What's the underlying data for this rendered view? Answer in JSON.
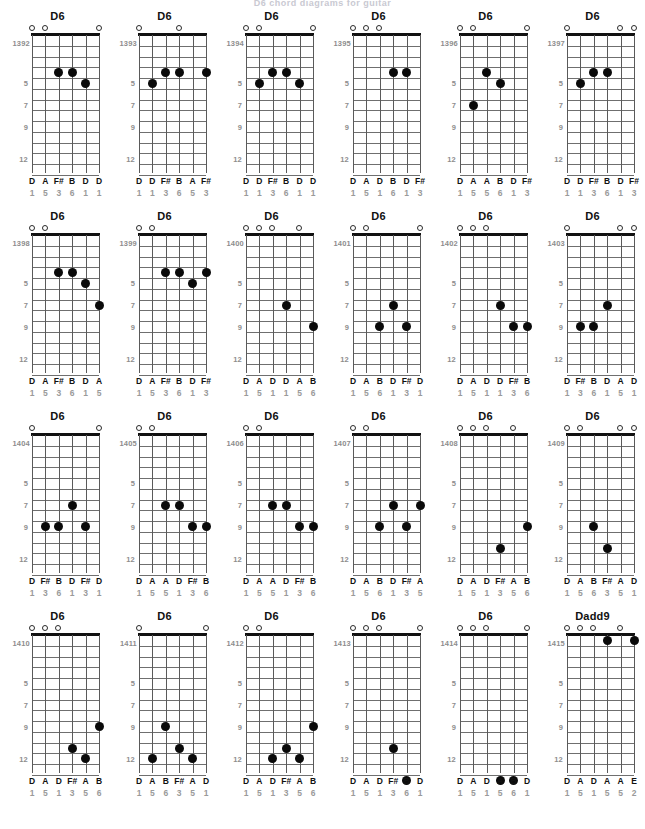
{
  "page": {
    "header_text": "D6 chord diagrams for guitar",
    "colors": {
      "dot": "#0a0a0a",
      "nut": "#111111",
      "fret_line": "#6f6f6f",
      "string_line": "#5a5a5a",
      "label_note": "#111111",
      "label_interval": "#9a9a9a",
      "label_id": "#8d8d8d",
      "background": "#ffffff"
    },
    "fret_marker_labels": [
      "5",
      "7",
      "9",
      "12"
    ],
    "fret_marker_rows": [
      5,
      7,
      9,
      12
    ],
    "strings": 6,
    "frets_shown": 13
  },
  "diagrams": [
    {
      "id": "1392",
      "name": "D6",
      "opens": [
        1,
        2,
        6
      ],
      "dots": [
        {
          "string": 3,
          "fret": 4
        },
        {
          "string": 4,
          "fret": 4
        },
        {
          "string": 5,
          "fret": 5
        }
      ],
      "notes": [
        "D",
        "A",
        "F#",
        "B",
        "D",
        "D"
      ],
      "intervals": [
        "1",
        "5",
        "3",
        "6",
        "1",
        "1"
      ]
    },
    {
      "id": "1393",
      "name": "D6",
      "opens": [
        1,
        4
      ],
      "dots": [
        {
          "string": 2,
          "fret": 5
        },
        {
          "string": 3,
          "fret": 4
        },
        {
          "string": 4,
          "fret": 4
        },
        {
          "string": 6,
          "fret": 4
        }
      ],
      "notes": [
        "D",
        "D",
        "F#",
        "B",
        "A",
        "F#"
      ],
      "intervals": [
        "1",
        "1",
        "3",
        "6",
        "5",
        "3"
      ]
    },
    {
      "id": "1394",
      "name": "D6",
      "opens": [
        1,
        2,
        6
      ],
      "dots": [
        {
          "string": 2,
          "fret": 5
        },
        {
          "string": 3,
          "fret": 4
        },
        {
          "string": 4,
          "fret": 4
        },
        {
          "string": 5,
          "fret": 5
        }
      ],
      "notes": [
        "D",
        "D",
        "F#",
        "B",
        "D",
        "D"
      ],
      "intervals": [
        "1",
        "1",
        "3",
        "6",
        "1",
        "1"
      ]
    },
    {
      "id": "1395",
      "name": "D6",
      "opens": [
        1,
        2,
        3
      ],
      "dots": [
        {
          "string": 4,
          "fret": 4
        },
        {
          "string": 5,
          "fret": 4
        }
      ],
      "notes": [
        "D",
        "A",
        "D",
        "B",
        "D",
        "F#"
      ],
      "intervals": [
        "1",
        "5",
        "1",
        "6",
        "1",
        "3"
      ]
    },
    {
      "id": "1396",
      "name": "D6",
      "opens": [
        1,
        2,
        6
      ],
      "dots": [
        {
          "string": 3,
          "fret": 4
        },
        {
          "string": 4,
          "fret": 5
        },
        {
          "string": 2,
          "fret": 7
        }
      ],
      "notes": [
        "D",
        "A",
        "A",
        "B",
        "D",
        "F#"
      ],
      "intervals": [
        "1",
        "5",
        "5",
        "6",
        "1",
        "3"
      ]
    },
    {
      "id": "1397",
      "name": "D6",
      "opens": [
        1,
        5,
        6
      ],
      "dots": [
        {
          "string": 2,
          "fret": 5
        },
        {
          "string": 3,
          "fret": 4
        },
        {
          "string": 4,
          "fret": 4
        }
      ],
      "notes": [
        "D",
        "D",
        "F#",
        "B",
        "D",
        "F#"
      ],
      "intervals": [
        "1",
        "1",
        "3",
        "6",
        "1",
        "3"
      ]
    },
    {
      "id": "1398",
      "name": "D6",
      "opens": [
        1,
        2
      ],
      "dots": [
        {
          "string": 3,
          "fret": 4
        },
        {
          "string": 4,
          "fret": 4
        },
        {
          "string": 5,
          "fret": 5
        },
        {
          "string": 6,
          "fret": 7
        }
      ],
      "notes": [
        "D",
        "A",
        "F#",
        "B",
        "D",
        "A"
      ],
      "intervals": [
        "1",
        "5",
        "3",
        "6",
        "1",
        "5"
      ]
    },
    {
      "id": "1399",
      "name": "D6",
      "opens": [
        1,
        2
      ],
      "dots": [
        {
          "string": 3,
          "fret": 4
        },
        {
          "string": 4,
          "fret": 4
        },
        {
          "string": 5,
          "fret": 5
        },
        {
          "string": 6,
          "fret": 4
        }
      ],
      "notes": [
        "D",
        "A",
        "F#",
        "B",
        "D",
        "F#"
      ],
      "intervals": [
        "1",
        "5",
        "3",
        "6",
        "1",
        "3"
      ]
    },
    {
      "id": "1400",
      "name": "D6",
      "opens": [
        1,
        2,
        3,
        5
      ],
      "dots": [
        {
          "string": 4,
          "fret": 7
        },
        {
          "string": 6,
          "fret": 9
        }
      ],
      "notes": [
        "D",
        "A",
        "D",
        "D",
        "A",
        "B"
      ],
      "intervals": [
        "1",
        "5",
        "1",
        "1",
        "5",
        "6"
      ]
    },
    {
      "id": "1401",
      "name": "D6",
      "opens": [
        1,
        2,
        6
      ],
      "dots": [
        {
          "string": 4,
          "fret": 7
        },
        {
          "string": 3,
          "fret": 9
        },
        {
          "string": 5,
          "fret": 9
        }
      ],
      "notes": [
        "D",
        "A",
        "B",
        "D",
        "F#",
        "D"
      ],
      "intervals": [
        "1",
        "5",
        "6",
        "1",
        "3",
        "1"
      ]
    },
    {
      "id": "1402",
      "name": "D6",
      "opens": [
        1,
        2,
        3
      ],
      "dots": [
        {
          "string": 4,
          "fret": 7
        },
        {
          "string": 5,
          "fret": 9
        },
        {
          "string": 6,
          "fret": 9
        }
      ],
      "notes": [
        "D",
        "A",
        "D",
        "D",
        "F#",
        "B"
      ],
      "intervals": [
        "1",
        "5",
        "1",
        "1",
        "3",
        "6"
      ]
    },
    {
      "id": "1403",
      "name": "D6",
      "opens": [
        1,
        5,
        6
      ],
      "dots": [
        {
          "string": 2,
          "fret": 9
        },
        {
          "string": 3,
          "fret": 9
        },
        {
          "string": 4,
          "fret": 7
        }
      ],
      "notes": [
        "D",
        "F#",
        "B",
        "D",
        "A",
        "D"
      ],
      "intervals": [
        "1",
        "3",
        "6",
        "1",
        "5",
        "1"
      ]
    },
    {
      "id": "1404",
      "name": "D6",
      "opens": [
        1,
        6
      ],
      "dots": [
        {
          "string": 2,
          "fret": 9
        },
        {
          "string": 3,
          "fret": 9
        },
        {
          "string": 4,
          "fret": 7
        },
        {
          "string": 5,
          "fret": 9
        }
      ],
      "notes": [
        "D",
        "F#",
        "B",
        "D",
        "F#",
        "D"
      ],
      "intervals": [
        "1",
        "3",
        "6",
        "1",
        "3",
        "1"
      ]
    },
    {
      "id": "1405",
      "name": "D6",
      "opens": [
        1,
        2
      ],
      "dots": [
        {
          "string": 3,
          "fret": 7
        },
        {
          "string": 4,
          "fret": 7
        },
        {
          "string": 5,
          "fret": 9
        },
        {
          "string": 6,
          "fret": 9
        }
      ],
      "notes": [
        "D",
        "A",
        "A",
        "D",
        "F#",
        "B"
      ],
      "intervals": [
        "1",
        "5",
        "5",
        "1",
        "3",
        "6"
      ]
    },
    {
      "id": "1406",
      "name": "D6",
      "opens": [
        1,
        2
      ],
      "dots": [
        {
          "string": 3,
          "fret": 7
        },
        {
          "string": 4,
          "fret": 7
        },
        {
          "string": 5,
          "fret": 9
        },
        {
          "string": 6,
          "fret": 9
        }
      ],
      "notes": [
        "D",
        "A",
        "A",
        "D",
        "F#",
        "B"
      ],
      "intervals": [
        "1",
        "5",
        "5",
        "1",
        "3",
        "6"
      ]
    },
    {
      "id": "1407",
      "name": "D6",
      "opens": [
        1,
        2
      ],
      "dots": [
        {
          "string": 3,
          "fret": 9
        },
        {
          "string": 4,
          "fret": 7
        },
        {
          "string": 5,
          "fret": 9
        },
        {
          "string": 6,
          "fret": 7
        }
      ],
      "notes": [
        "D",
        "A",
        "B",
        "D",
        "F#",
        "A"
      ],
      "intervals": [
        "1",
        "5",
        "6",
        "1",
        "3",
        "5"
      ]
    },
    {
      "id": "1408",
      "name": "D6",
      "opens": [
        1,
        2,
        3,
        5
      ],
      "dots": [
        {
          "string": 6,
          "fret": 9
        },
        {
          "string": 4,
          "fret": 11
        }
      ],
      "notes": [
        "D",
        "A",
        "D",
        "F#",
        "A",
        "B"
      ],
      "intervals": [
        "1",
        "5",
        "1",
        "3",
        "5",
        "6"
      ]
    },
    {
      "id": "1409",
      "name": "D6",
      "opens": [
        1,
        2,
        5,
        6
      ],
      "dots": [
        {
          "string": 3,
          "fret": 9
        },
        {
          "string": 4,
          "fret": 11
        }
      ],
      "notes": [
        "D",
        "A",
        "B",
        "F#",
        "A",
        "D"
      ],
      "intervals": [
        "1",
        "5",
        "6",
        "3",
        "5",
        "1"
      ]
    },
    {
      "id": "1410",
      "name": "D6",
      "opens": [
        1,
        2,
        3
      ],
      "dots": [
        {
          "string": 6,
          "fret": 9
        },
        {
          "string": 4,
          "fret": 11
        },
        {
          "string": 5,
          "fret": 12
        }
      ],
      "notes": [
        "D",
        "A",
        "D",
        "F#",
        "A",
        "B"
      ],
      "intervals": [
        "1",
        "5",
        "1",
        "3",
        "5",
        "6"
      ]
    },
    {
      "id": "1411",
      "name": "D6",
      "opens": [
        1,
        6
      ],
      "dots": [
        {
          "string": 3,
          "fret": 9
        },
        {
          "string": 4,
          "fret": 11
        },
        {
          "string": 2,
          "fret": 12
        },
        {
          "string": 5,
          "fret": 12
        }
      ],
      "notes": [
        "D",
        "A",
        "B",
        "F#",
        "A",
        "D"
      ],
      "intervals": [
        "1",
        "5",
        "6",
        "3",
        "5",
        "1"
      ]
    },
    {
      "id": "1412",
      "name": "D6",
      "opens": [
        1,
        2
      ],
      "dots": [
        {
          "string": 6,
          "fret": 9
        },
        {
          "string": 4,
          "fret": 11
        },
        {
          "string": 3,
          "fret": 12
        },
        {
          "string": 5,
          "fret": 12
        }
      ],
      "notes": [
        "D",
        "A",
        "D",
        "F#",
        "A",
        "B"
      ],
      "intervals": [
        "1",
        "5",
        "1",
        "3",
        "5",
        "6"
      ]
    },
    {
      "id": "1413",
      "name": "D6",
      "opens": [
        1,
        2,
        3,
        6
      ],
      "dots": [
        {
          "string": 4,
          "fret": 11
        },
        {
          "string": 5,
          "fret": 14
        }
      ],
      "notes": [
        "D",
        "A",
        "D",
        "F#",
        "B",
        "D"
      ],
      "intervals": [
        "1",
        "5",
        "1",
        "3",
        "6",
        "1"
      ]
    },
    {
      "id": "1414",
      "name": "D6",
      "opens": [
        1,
        2,
        3,
        6
      ],
      "dots": [
        {
          "string": 4,
          "fret": 14
        },
        {
          "string": 5,
          "fret": 14
        }
      ],
      "notes": [
        "D",
        "A",
        "D",
        "A",
        "B",
        "D"
      ],
      "intervals": [
        "1",
        "5",
        "1",
        "5",
        "6",
        "1"
      ]
    },
    {
      "id": "1415",
      "name": "Dadd9",
      "opens": [
        1,
        2,
        3,
        5
      ],
      "dots": [
        {
          "string": 4,
          "fret": 1
        },
        {
          "string": 6,
          "fret": 1
        }
      ],
      "notes": [
        "D",
        "A",
        "D",
        "A",
        "A",
        "E"
      ],
      "intervals": [
        "1",
        "5",
        "1",
        "5",
        "5",
        "2"
      ]
    }
  ]
}
